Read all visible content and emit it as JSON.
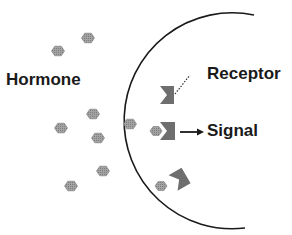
{
  "diagram": {
    "labels": {
      "hormone": "Hormone",
      "receptor": "Receptor",
      "signal": "Signal"
    },
    "colors": {
      "membrane": "#1a1a1a",
      "receptor": "#6e6e6e",
      "hormone_fill": "#9a9a9a",
      "hormone_stroke": "#7a7a7a",
      "text": "#1a1a1a"
    },
    "membrane": {
      "cx": 222,
      "cy": 120,
      "r": 108,
      "start_angle_deg": 210,
      "end_angle_deg": 145
    },
    "free_hormones": [
      {
        "x": 70,
        "y": 51
      },
      {
        "x": 58,
        "y": 50
      },
      {
        "x": 93,
        "y": 114
      },
      {
        "x": 61,
        "y": 128
      },
      {
        "x": 98,
        "y": 138
      },
      {
        "x": 130,
        "y": 124
      },
      {
        "x": 103,
        "y": 171
      },
      {
        "x": 71,
        "y": 186
      }
    ],
    "receptors": [
      {
        "id": "receptor-1",
        "x": 160,
        "y": 86,
        "state": "unbound",
        "rotation": 0
      },
      {
        "id": "receptor-2",
        "x": 160,
        "y": 122,
        "state": "bound",
        "rotation": 0
      },
      {
        "id": "receptor-3",
        "x": 170,
        "y": 168,
        "state": "unbound",
        "rotation": -30
      }
    ],
    "bound_hormones": [
      {
        "x": 156,
        "y": 131
      },
      {
        "x": 161,
        "y": 186
      }
    ]
  }
}
